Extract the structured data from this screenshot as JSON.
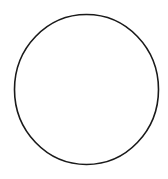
{
  "canvas": {
    "width": 168,
    "height": 179,
    "background": "#ffffff"
  },
  "shape": {
    "type": "ellipse",
    "cx": 86.5,
    "cy": 89.5,
    "rx": 72,
    "ry": 75,
    "stroke": "#1a1a1a",
    "stroke_width": 1.6,
    "fill": "none"
  }
}
